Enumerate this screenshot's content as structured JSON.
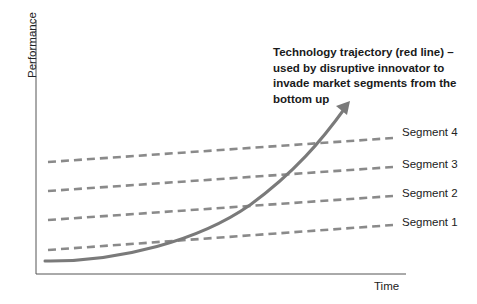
{
  "axes": {
    "y_label": "Performance",
    "x_label": "Time"
  },
  "annotation": {
    "text": "Technology trajectory (red line) –\nused by disruptive innovator to\ninvade market segments from the\nbottom up"
  },
  "segments": [
    {
      "label": "Segment 4"
    },
    {
      "label": "Segment 3"
    },
    {
      "label": "Segment 2"
    },
    {
      "label": "Segment 1"
    }
  ],
  "colors": {
    "axis": "#555555",
    "dashed_line": "#8a8a8a",
    "trajectory": "#7a7a7a",
    "text": "#222222"
  }
}
